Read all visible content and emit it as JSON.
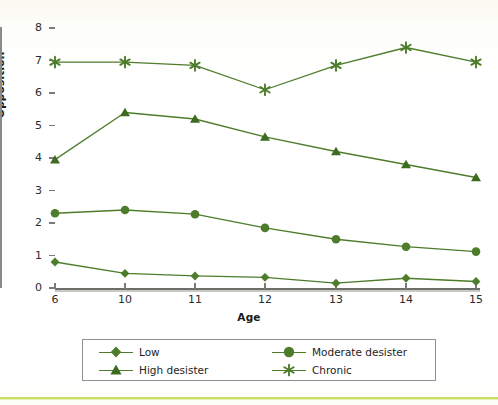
{
  "chart_data": {
    "type": "line",
    "title": "",
    "xlabel": "Age",
    "ylabel": "Opposition",
    "x": [
      6,
      10,
      11,
      12,
      13,
      14,
      15
    ],
    "xtick_labels": [
      "6",
      "10",
      "11",
      "12",
      "13",
      "14",
      "15"
    ],
    "ytick_labels": [
      "0",
      "1",
      "2",
      "3",
      "4",
      "5",
      "6",
      "7",
      "8"
    ],
    "ylim": [
      0,
      8
    ],
    "grid": false,
    "legend_position": "bottom",
    "line_color": "#4d7c2a",
    "series": [
      {
        "name": "Low",
        "marker": "diamond",
        "values": [
          0.8,
          0.45,
          0.37,
          0.33,
          0.15,
          0.3,
          0.2
        ]
      },
      {
        "name": "Moderate desister",
        "marker": "circle",
        "values": [
          2.3,
          2.4,
          2.27,
          1.85,
          1.5,
          1.27,
          1.12
        ]
      },
      {
        "name": "High desister",
        "marker": "triangle",
        "values": [
          3.95,
          5.4,
          5.2,
          4.65,
          4.2,
          3.8,
          3.4
        ]
      },
      {
        "name": "Chronic",
        "marker": "asterisk",
        "values": [
          6.95,
          6.95,
          6.85,
          6.1,
          6.85,
          7.4,
          6.95
        ]
      }
    ]
  },
  "legend": {
    "entries": [
      {
        "label": "Low",
        "marker": "diamond"
      },
      {
        "label": "Moderate desister",
        "marker": "circle"
      },
      {
        "label": "High desister",
        "marker": "triangle"
      },
      {
        "label": "Chronic",
        "marker": "asterisk"
      }
    ]
  },
  "colors": {
    "series": "#4d7c2a",
    "axis": "#7a7a76",
    "text": "#1e1e1e",
    "accent_rule": "#c3d648"
  }
}
